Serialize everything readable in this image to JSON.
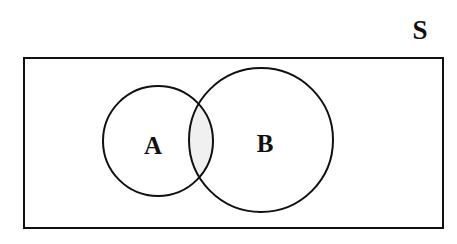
{
  "diagram": {
    "type": "venn-diagram",
    "title_label": "S",
    "universe": {
      "name": "universe-rectangle",
      "label": "S",
      "label_position": "top-right-outside",
      "x": 24,
      "y": 58,
      "width": 419,
      "height": 170,
      "stroke": "#101010",
      "stroke_width": 2,
      "fill": "#ffffff"
    },
    "sets": [
      {
        "name": "set-a",
        "label": "A",
        "cx": 158,
        "cy": 141,
        "r": 55,
        "stroke": "#101010",
        "stroke_width": 2,
        "fill": "#ffffff",
        "label_x": 153,
        "label_y": 145
      },
      {
        "name": "set-b",
        "label": "B",
        "cx": 261,
        "cy": 140,
        "r": 72,
        "stroke": "#101010",
        "stroke_width": 2,
        "fill": "#ffffff",
        "label_x": 265,
        "label_y": 143
      }
    ],
    "intersection": {
      "name": "intersection-region",
      "label": "",
      "fill": "#f0f0f0",
      "shaded": true,
      "description": "A intersect B"
    },
    "background": "#ffffff"
  }
}
